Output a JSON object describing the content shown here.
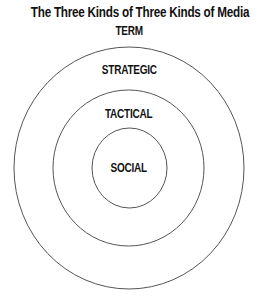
{
  "diagram": {
    "title": "The Three Kinds of Three Kinds of Media",
    "subtitle": "TERM",
    "rings": [
      {
        "label": "STRATEGIC",
        "level": "outer"
      },
      {
        "label": "TACTICAL",
        "level": "middle"
      },
      {
        "label": "SOCIAL",
        "level": "inner"
      }
    ],
    "colors": {
      "text": "#111111",
      "stroke": "#555555",
      "background": "#ffffff"
    }
  }
}
